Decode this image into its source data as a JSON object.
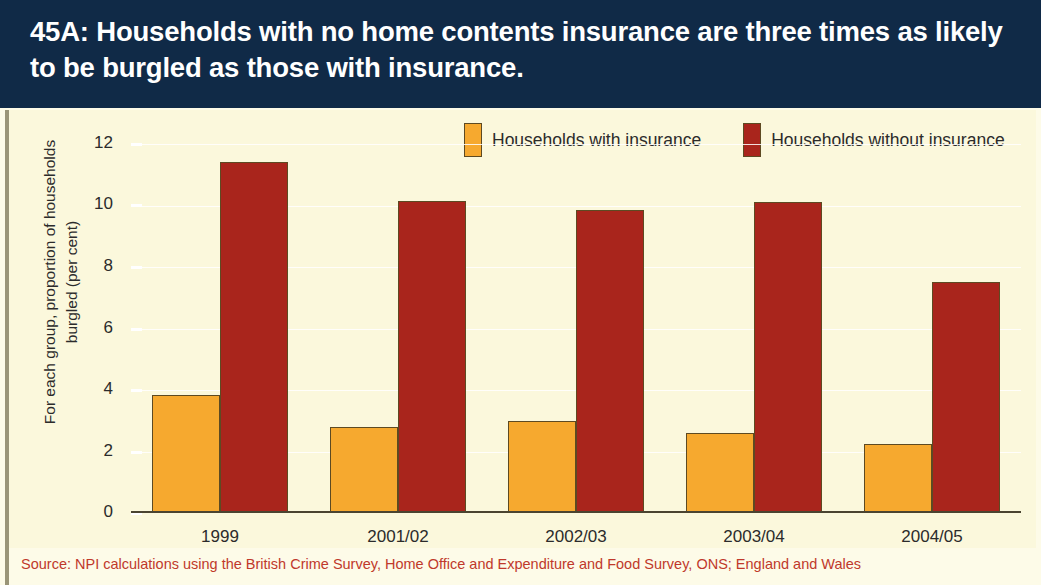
{
  "header": {
    "title": "45A: Households with no home contents insurance are three times as likely to be burgled as those with insurance."
  },
  "legend": {
    "entries": [
      {
        "label": "Households with insurance",
        "color": "#f6a92f",
        "key": "with"
      },
      {
        "label": "Households without insurance",
        "color": "#a9251c",
        "key": "without"
      }
    ]
  },
  "axes": {
    "y_title_line1": "For each group, proportion of households",
    "y_title_line2": "burgled (per cent)",
    "y_ticks": [
      "12",
      "10",
      "8",
      "6",
      "4",
      "2",
      "0"
    ]
  },
  "source": {
    "text": "Source: NPI calculations using the British Crime Survey, Home Office and Expenditure and Food Survey, ONS; England and Wales"
  },
  "colors": {
    "header_background": "#102a47",
    "plot_background": "#fbf8dc",
    "page_background": "#fdfbe8",
    "with_insurance": "#f6a92f",
    "without_insurance": "#a9251c",
    "source_text": "#c0392b",
    "axis_line": "#4a4430"
  },
  "chart_data": {
    "type": "bar",
    "title": "45A: Households with no home contents insurance are three times as likely to be burgled as those with insurance.",
    "xlabel": "",
    "ylabel": "For each group, proportion of households burgled (per cent)",
    "categories": [
      "1999",
      "2001/02",
      "2002/03",
      "2003/04",
      "2004/05"
    ],
    "series": [
      {
        "name": "Households with insurance",
        "color": "#f6a92f",
        "values": [
          3.85,
          2.8,
          3.0,
          2.6,
          2.25
        ]
      },
      {
        "name": "Households without insurance",
        "color": "#a9251c",
        "values": [
          11.4,
          10.15,
          9.85,
          10.1,
          7.5
        ]
      }
    ],
    "ylim": [
      0,
      12
    ],
    "ytick_step": 2,
    "grid": true,
    "legend_position": "top-right",
    "source": "Source: NPI calculations using the British Crime Survey, Home Office and Expenditure and Food Survey, ONS; England and Wales"
  }
}
